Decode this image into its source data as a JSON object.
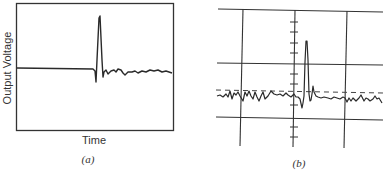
{
  "panel_a": {
    "caption": "(a)",
    "xlabel": "Time",
    "ylabel": "Output Voltage",
    "trace_points": "17,68 93,69 95,71 96,82 97,60 99,18 100,16 102,60 103,77 104,72 106,70 108,74 111,71 114,70 116,72 118,69 121,70 123,73 125,75 128,72 132,72 135,71 138,73 142,71 146,72 150,70 154,71 158,70 162,72 166,71 172,73"
  },
  "panel_b": {
    "caption": "(b)",
    "trace_points": "217,96 220,95 223,97 226,94 228,97 230,91 232,99 234,93 236,95 238,92 240,96 243,101 245,92 247,96 249,91 251,96 253,99 255,92 257,97 259,101 261,96 263,92 265,99 268,96 271,91 274,94 277,95 280,94 283,96 286,93 288,95 291,97 294,94 296,97 298,97 300,99 302,108 303,103 304,96 305,62 306,41 307,41 308,60 309,94 310,101 311,100 312,94 313,86 314,92 316,96 318,97 321,98 324,97 328,98 331,99 334,97 337,98 340,99 343,97 345,98 347,102 349,98 351,101 353,98 356,101 359,98 361,95 362,97 364,101 366,98 368,99 370,101 373,99 375,96 377,99 379,98 382,103",
    "grid_color": "#333333",
    "dashed_baseline_y": 92
  },
  "colors": {
    "ink": "#2a2a2a",
    "background": "#ffffff"
  }
}
